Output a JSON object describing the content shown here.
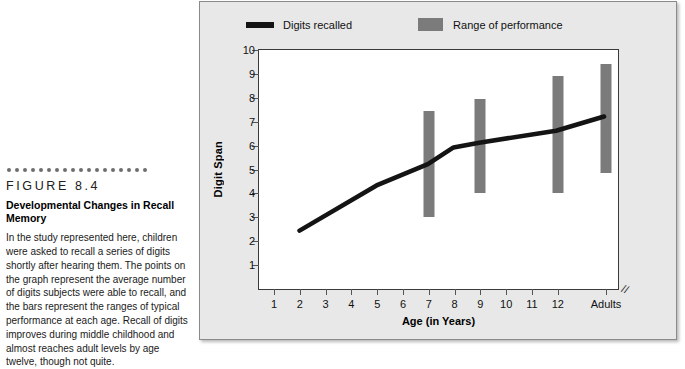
{
  "caption": {
    "figure_label": "FIGURE 8.4",
    "title": "Developmental Changes in Recall Memory",
    "body": "In the study represented here, children were asked to recall a series of digits shortly after hearing them. The points on the graph represent the average number of digits subjects were able to recall, and the bars represent the ranges of typical performance at each age. Recall of digits improves during middle childhood and almost reaches adult levels by age twelve, though not quite.",
    "dot_count": 18,
    "dot_color": "#6e6e6e"
  },
  "chart_data": {
    "type": "line",
    "title": "",
    "xlabel": "Age (in Years)",
    "ylabel": "Digit Span",
    "ylim": [
      0,
      10
    ],
    "yticks": [
      1,
      2,
      3,
      4,
      5,
      6,
      7,
      8,
      9,
      10
    ],
    "xticks": [
      "1",
      "2",
      "3",
      "4",
      "5",
      "6",
      "7",
      "8",
      "9",
      "10",
      "11",
      "12",
      "Adults"
    ],
    "axis_break_after": "12",
    "grid": false,
    "legend": [
      {
        "label": "Digits recalled",
        "marker": "line",
        "color": "#141414"
      },
      {
        "label": "Range of performance",
        "marker": "box",
        "color": "#7b7b7b"
      }
    ],
    "series": [
      {
        "name": "Digits recalled",
        "type": "line",
        "color": "#141414",
        "points": [
          {
            "x": "2",
            "y": 2.4
          },
          {
            "x": "5",
            "y": 4.3
          },
          {
            "x": "7",
            "y": 5.2
          },
          {
            "x": "8",
            "y": 5.9
          },
          {
            "x": "9",
            "y": 6.1
          },
          {
            "x": "12",
            "y": 6.6
          },
          {
            "x": "Adults",
            "y": 7.2
          }
        ]
      },
      {
        "name": "Range of performance",
        "type": "range-bars",
        "color": "#7b7b7b",
        "bars": [
          {
            "x": "7",
            "low": 3.0,
            "high": 7.45
          },
          {
            "x": "9",
            "low": 4.0,
            "high": 7.95
          },
          {
            "x": "12",
            "low": 4.0,
            "high": 8.9
          },
          {
            "x": "Adults",
            "low": 4.85,
            "high": 9.4
          }
        ]
      }
    ]
  },
  "colors": {
    "panel_background": "#e8e8e8",
    "plot_background": "#ffffff",
    "line": "#141414",
    "bar": "#7b7b7b",
    "axis": "#3a3a3a"
  }
}
